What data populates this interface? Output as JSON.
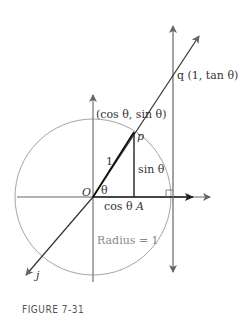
{
  "figure": {
    "caption": "FIGURE 7-31",
    "labels": {
      "point_q": "q (1, tan θ)",
      "point_p_coords": "(cos θ, sin θ)",
      "point_p": "p",
      "hypotenuse": "1",
      "angle": "θ",
      "origin": "O",
      "adjacent": "cos θ",
      "point_A": "A",
      "opposite": "sin θ",
      "radius": "Radius = 1",
      "line_label": "j"
    },
    "colors": {
      "dark_line": "#222222",
      "gray_line": "#666666",
      "circle": "#999999"
    }
  }
}
